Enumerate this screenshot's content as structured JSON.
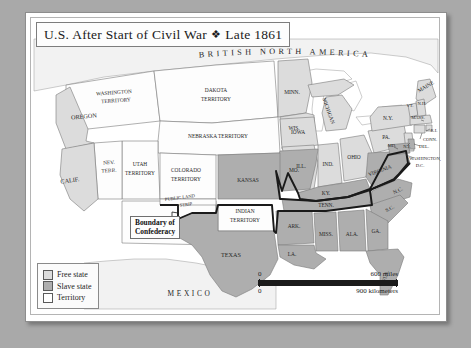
{
  "title": {
    "text": "U.S. After Start of Civil War",
    "diamond": "❖",
    "date": "Late 1861"
  },
  "regions": {
    "north": "BRITISH NORTH AMERICA",
    "south": "MEXICO"
  },
  "legend": {
    "items": [
      {
        "label": "Free state",
        "color": "#dcdcdc"
      },
      {
        "label": "Slave state",
        "color": "#aeaeae"
      },
      {
        "label": "Territory",
        "color": "#ffffff"
      }
    ]
  },
  "scale": {
    "miles_zero": "0",
    "miles_label": "600 miles",
    "km_zero": "0",
    "km_label": "900 kilometers"
  },
  "callout": {
    "line1": "Boundary of",
    "line2": "Confederacy"
  },
  "labels": {
    "washington_territory_1": "WASHINGTON",
    "washington_territory_2": "TERRITORY",
    "oregon": "OREGON",
    "calif": "CALIF.",
    "nev_1": "NEV.",
    "nev_2": "TERR.",
    "utah_1": "UTAH",
    "utah_2": "TERRITORY",
    "dakota_1": "DAKOTA",
    "dakota_2": "TERRITORY",
    "nebraska": "NEBRASKA TERRITORY",
    "colorado_1": "COLORADO",
    "colorado_2": "TERRITORY",
    "kansas": "KANSAS",
    "new_mexico_1": "NEW MEXICO",
    "new_mexico_2": "TERRITORY",
    "public_land_1": "PUBLIC LAND",
    "public_land_2": "STRIP",
    "indian_1": "INDIAN",
    "indian_2": "TERRITORY",
    "texas": "TEXAS",
    "minn": "MINN.",
    "wis": "WIS.",
    "michigan": "MICHIGAN",
    "iowa": "IOWA",
    "mo": "MO.",
    "ill": "ILL.",
    "ind": "IND.",
    "ohio": "OHIO",
    "ky": "KY.",
    "ark": "ARK.",
    "tenn": "TENN.",
    "la": "LA.",
    "miss": "MISS.",
    "ala": "ALA.",
    "ga": "GA.",
    "fla": "FLA.",
    "sc": "S.C.",
    "nc": "N.C.",
    "virginia": "VIRGINIA",
    "pa": "PA.",
    "ny": "N.Y.",
    "maine": "MAINE",
    "vt": "VT.",
    "nh": "N.H.",
    "mass": "MASS.",
    "ri": "R.I.",
    "conn": "CONN.",
    "nj": "N.J.",
    "del": "DEL.",
    "md": "MD.",
    "dc_1": "WASHINGTON,",
    "dc_2": "D.C."
  },
  "colors": {
    "background": "#a9a9a9",
    "panel": "#ffffff",
    "free_state": "#dcdcdc",
    "slave_state": "#aeaeae",
    "territory": "#fdfdfd",
    "foreign": "#f2f2f2",
    "water": "#ffffff",
    "border_line": "#7a7a7a",
    "confederacy_line": "#1a1a1a"
  }
}
